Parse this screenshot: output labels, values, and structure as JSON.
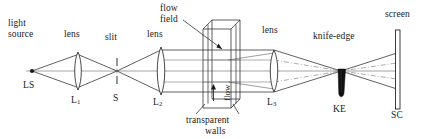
{
  "figure": {
    "type": "schlieren-optical-system-diagram",
    "background_color": "#ffffff",
    "line_color": "#1a1a1a",
    "knife_edge_fill": "#111111"
  },
  "labels": {
    "light_source_line1": "light",
    "light_source_line2": "source",
    "lens1_top": "lens",
    "slit_top": "slit",
    "lens2_top": "lens",
    "flow_field_line1": "flow",
    "flow_field_line2": "field",
    "lens3_top": "lens",
    "knife_edge_top": "knife-edge",
    "screen_top": "screen",
    "light_source_symbol": "LS",
    "lens1_symbol": "L",
    "lens1_sub": "1",
    "slit_symbol": "S",
    "lens2_symbol": "L",
    "lens2_sub": "2",
    "lens3_symbol": "L",
    "lens3_sub": "3",
    "knife_edge_symbol": "KE",
    "screen_symbol": "SC",
    "flow_arrow_label": "flow",
    "transparent_walls_line1": "transparent",
    "transparent_walls_line2": "walls"
  },
  "components": [
    {
      "name": "light-source",
      "symbol": "LS",
      "label": "light source",
      "x": 32
    },
    {
      "name": "lens-1",
      "symbol": "L1",
      "label": "lens",
      "x": 78
    },
    {
      "name": "slit",
      "symbol": "S",
      "label": "slit",
      "x": 117
    },
    {
      "name": "lens-2",
      "symbol": "L2",
      "label": "lens",
      "x": 161
    },
    {
      "name": "flow-field",
      "symbol": "",
      "label": "flow field",
      "x": 219
    },
    {
      "name": "transparent-walls",
      "symbol": "",
      "label": "transparent walls",
      "x": 219
    },
    {
      "name": "lens-3",
      "symbol": "L3",
      "label": "lens",
      "x": 274
    },
    {
      "name": "knife-edge",
      "symbol": "KE",
      "label": "knife-edge",
      "x": 341
    },
    {
      "name": "screen",
      "symbol": "SC",
      "label": "screen",
      "x": 398
    }
  ]
}
